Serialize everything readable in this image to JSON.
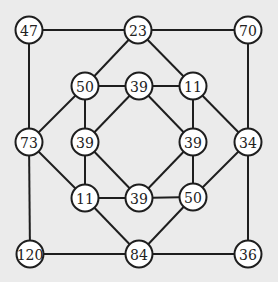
{
  "diagram": {
    "type": "number-graph",
    "colors": {
      "background": "#ebebeb",
      "line": "#1e1e1e",
      "node_fill": "#ffffff",
      "text": "#222222"
    },
    "nodes": [
      {
        "id": "outer-tl",
        "label": "47"
      },
      {
        "id": "outer-tm",
        "label": "23"
      },
      {
        "id": "outer-tr",
        "label": "70"
      },
      {
        "id": "outer-ml",
        "label": "73"
      },
      {
        "id": "outer-mr",
        "label": "34"
      },
      {
        "id": "outer-bl",
        "label": "120"
      },
      {
        "id": "outer-bm",
        "label": "84"
      },
      {
        "id": "outer-br",
        "label": "36"
      },
      {
        "id": "inner-tl",
        "label": "50"
      },
      {
        "id": "inner-tm",
        "label": "39"
      },
      {
        "id": "inner-tr",
        "label": "11"
      },
      {
        "id": "inner-ml",
        "label": "39"
      },
      {
        "id": "inner-mr",
        "label": "39"
      },
      {
        "id": "inner-bl",
        "label": "11"
      },
      {
        "id": "inner-bm",
        "label": "39"
      },
      {
        "id": "inner-br",
        "label": "50"
      }
    ],
    "edges": [
      [
        "outer-tl",
        "outer-tm"
      ],
      [
        "outer-tm",
        "outer-tr"
      ],
      [
        "outer-tl",
        "outer-ml"
      ],
      [
        "outer-ml",
        "outer-bl"
      ],
      [
        "outer-bl",
        "outer-bm"
      ],
      [
        "outer-bm",
        "outer-br"
      ],
      [
        "outer-tr",
        "outer-mr"
      ],
      [
        "outer-mr",
        "outer-br"
      ],
      [
        "outer-tm",
        "inner-tl"
      ],
      [
        "outer-tm",
        "inner-tr"
      ],
      [
        "outer-ml",
        "inner-tl"
      ],
      [
        "outer-ml",
        "inner-bl"
      ],
      [
        "outer-mr",
        "inner-tr"
      ],
      [
        "outer-mr",
        "inner-br"
      ],
      [
        "outer-bm",
        "inner-bl"
      ],
      [
        "outer-bm",
        "inner-br"
      ],
      [
        "inner-tl",
        "inner-tm"
      ],
      [
        "inner-tm",
        "inner-tr"
      ],
      [
        "inner-tr",
        "inner-mr"
      ],
      [
        "inner-mr",
        "inner-br"
      ],
      [
        "inner-br",
        "inner-bm"
      ],
      [
        "inner-bm",
        "inner-bl"
      ],
      [
        "inner-bl",
        "inner-ml"
      ],
      [
        "inner-ml",
        "inner-tl"
      ],
      [
        "inner-tm",
        "inner-ml"
      ],
      [
        "inner-tm",
        "inner-mr"
      ],
      [
        "inner-ml",
        "inner-bm"
      ],
      [
        "inner-mr",
        "inner-bm"
      ]
    ]
  }
}
